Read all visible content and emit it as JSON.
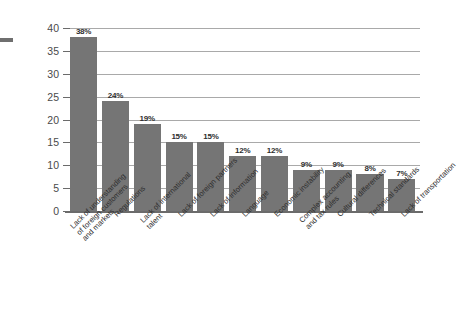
{
  "chart_data": {
    "type": "bar",
    "title": "",
    "subtitle": "",
    "xlabel": "",
    "ylabel": "Percentage of respondents",
    "ylim": [
      0,
      40
    ],
    "yticks": [
      40,
      35,
      30,
      25,
      20,
      15,
      10,
      5,
      0
    ],
    "grid": true,
    "legend": false,
    "legend_position": "none",
    "value_suffix": "%",
    "categories": [
      "Lack of understanding of foreign customers and markets",
      "Regulations",
      "Lack of international talent",
      "Lack of foreign partners",
      "Lack of information",
      "Language",
      "Economic instability",
      "Complex accounting and tax rules",
      "Cultural differences",
      "Technical standards",
      "Lack of transportation"
    ],
    "category_lines": [
      [
        "Lack of understanding",
        "of foreign customers",
        "and markets"
      ],
      [
        "Regulations"
      ],
      [
        "Lack of international",
        "talent"
      ],
      [
        "Lack of foreign partners"
      ],
      [
        "Lack of information"
      ],
      [
        "Language"
      ],
      [
        "Economic instability"
      ],
      [
        "Complex accounting",
        "and tax rules"
      ],
      [
        "Cultural differences"
      ],
      [
        "Technical standards"
      ],
      [
        "Lack of transportation"
      ]
    ],
    "values": [
      38,
      24,
      19,
      15,
      15,
      12,
      12,
      9,
      9,
      8,
      7
    ],
    "value_labels": [
      "38%",
      "24%",
      "19%",
      "15%",
      "15%",
      "12%",
      "12%",
      "9%",
      "9%",
      "8%",
      "7%"
    ],
    "colors": {
      "bar_fill": "#757575",
      "gridline": "#a9a9a9",
      "axis_line": "#6b6b6b",
      "tick_text": "#4a4a4a",
      "value_text": "#2e2e2e",
      "category_text": "#2e2e2e",
      "background": "#ffffff"
    }
  }
}
